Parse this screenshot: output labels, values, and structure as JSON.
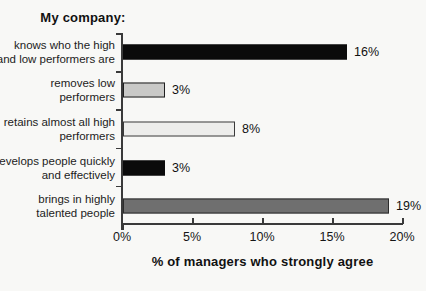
{
  "chart_data": {
    "type": "bar",
    "orientation": "horizontal",
    "title": "My company:",
    "xlabel": "% of managers who strongly agree",
    "categories": [
      "knows who the high and low performers are",
      "removes low performers",
      "retains almost all high performers",
      "develops people quickly and effectively",
      "brings in highly talented people"
    ],
    "values": [
      16,
      3,
      8,
      3,
      19
    ],
    "xlim": [
      0,
      20
    ],
    "x_tick_values": [
      0,
      5,
      10,
      15,
      20
    ],
    "x_ticks": [
      "0%",
      "5%",
      "10%",
      "15%",
      "20%"
    ],
    "grid": false,
    "legend": "none",
    "bars": [
      {
        "lines": "knows who the high\nand low performers are",
        "value": 16,
        "label": "16%",
        "fill": "#0b0b0b",
        "stroke": "#0b0b0b"
      },
      {
        "lines": "removes low\nperformers",
        "value": 3,
        "label": "3%",
        "fill": "#c9c9c7",
        "stroke": "#1f1f1f"
      },
      {
        "lines": "retains almost all high\nperformers",
        "value": 8,
        "label": "8%",
        "fill": "#ededeb",
        "stroke": "#3a3a3a"
      },
      {
        "lines": "develops people quickly\nand effectively",
        "value": 3,
        "label": "3%",
        "fill": "#0b0b0b",
        "stroke": "#0b0b0b"
      },
      {
        "lines": "brings in highly\ntalented people",
        "value": 19,
        "label": "19%",
        "fill": "#6f6f6f",
        "stroke": "#2c2c2c"
      }
    ]
  }
}
